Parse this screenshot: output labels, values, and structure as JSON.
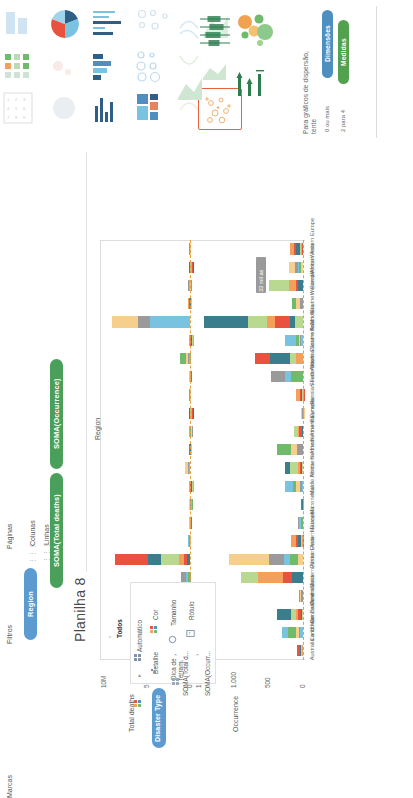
{
  "show_me": {
    "panel_name": "Mostre-me",
    "hint_title": "Para gráficos de dispersão,",
    "hint_title2": "tente",
    "dimensions_pill": "Dimensões",
    "dimensions_req": "0 ou mais",
    "measures_pill": "Medidas",
    "measures_req": "2 para 4",
    "selected_thumb": "scatter-plot",
    "accent_selected": "#e8603c",
    "thumbs": [
      {
        "name": "text-table",
        "row": 0,
        "col": 0
      },
      {
        "name": "heat-map",
        "row": 1,
        "col": 0
      },
      {
        "name": "highlight-table",
        "row": 2,
        "col": 0
      },
      {
        "name": "symbol-map",
        "row": 0,
        "col": 1
      },
      {
        "name": "filled-map",
        "row": 1,
        "col": 1
      },
      {
        "name": "pie-chart",
        "row": 2,
        "col": 1
      },
      {
        "name": "horizontal-bar",
        "row": 0,
        "col": 2
      },
      {
        "name": "stacked-bar",
        "row": 1,
        "col": 2
      },
      {
        "name": "side-by-side-bar",
        "row": 2,
        "col": 2
      },
      {
        "name": "treemap",
        "row": 0,
        "col": 3
      },
      {
        "name": "circle-view",
        "row": 1,
        "col": 3
      },
      {
        "name": "side-by-side-circle",
        "row": 2,
        "col": 3
      },
      {
        "name": "line-discrete",
        "row": 0,
        "col": 4
      },
      {
        "name": "line-continuous",
        "row": 1,
        "col": 4
      },
      {
        "name": "dual-line",
        "row": 2,
        "col": 4
      },
      {
        "name": "area-continuous",
        "row": 0,
        "col": 5
      },
      {
        "name": "area-discrete",
        "row": 1,
        "col": 5
      },
      {
        "name": "scatter-plot",
        "row": 2,
        "col": 5
      },
      {
        "name": "box-and-whisker",
        "row": 0,
        "col": 6
      },
      {
        "name": "packed-bubbles",
        "row": 1,
        "col": 6
      },
      {
        "name": "gantt",
        "row": 2,
        "col": 6
      },
      {
        "name": "bullet-graph",
        "row": 0,
        "col": 7
      },
      {
        "name": "histogram",
        "row": 1,
        "col": 7
      }
    ]
  },
  "workbench": {
    "pages_label": "Páginas",
    "filters_label": "Filtros",
    "marks_label": "Marcas",
    "columns_label": "Colunas",
    "rows_label": "Linhas",
    "sheet_title": "Planilha 8",
    "columns_pills": [
      {
        "label": "SOMA(Total deaths)",
        "type": "green"
      },
      {
        "label": "SOMA(Occurrence)",
        "type": "green"
      }
    ],
    "rows_pills": [
      {
        "label": "Region",
        "type": "blue"
      }
    ]
  },
  "marks_card": {
    "title": "Marcas",
    "all_label": "Todos",
    "mark_type": "Automático",
    "buttons": [
      {
        "name": "color",
        "label": "Cor"
      },
      {
        "name": "size",
        "label": "Tamanho"
      },
      {
        "name": "label",
        "label": "Rótulo"
      },
      {
        "name": "detail",
        "label": "Detalhe"
      },
      {
        "name": "tooltip",
        "label": "Dica de\nferram."
      }
    ],
    "mark_pill": "Disaster Type",
    "measure_cards": [
      {
        "label": "SOMA(Total d..."
      },
      {
        "label": "SOMA(Occurr..."
      }
    ]
  },
  "chart_data": {
    "type": "bar",
    "orientation": "horizontal-stacked",
    "title": "",
    "xlabel": "Region",
    "panes": [
      {
        "name": "total-deaths-pane",
        "measure": "Total deaths",
        "axis_label": "Total deaths",
        "ticks": [
          "10M",
          "5M",
          "0M"
        ],
        "xlim": [
          0,
          12000000
        ],
        "grid": false
      },
      {
        "name": "occurrence-pane",
        "measure": "Occurrence",
        "axis_label": "Occurrence",
        "ticks": [
          "1.500",
          "1.000",
          "500",
          "0"
        ],
        "xlim": [
          0,
          1700
        ],
        "grid": false
      }
    ],
    "legend_field": "Disaster Type",
    "colors": {
      "Flood": "#7ac3e0",
      "Storm": "#f4a05a",
      "Earthquake": "#6fba6b",
      "Epidemic": "#e8523f",
      "Drought": "#f6cf8c",
      "Landslide": "#3a7d8c",
      "Extreme temperature": "#9a9a9a",
      "Other": "#b8d98f"
    },
    "annotation": "33 mil as",
    "categories": [
      "Western Europe",
      "Western Asia",
      "Western Africa",
      "Southern Europe",
      "South Asia",
      "Southern Africa",
      "South-Eastern Asia",
      "South America",
      "Russian Federation",
      "Polynesia",
      "Northern Europe",
      "Northern America",
      "Northern Africa",
      "Middle Africa",
      "Micronesia",
      "Melanesia",
      "Eastern Europe",
      "Eastern Asia",
      "Eastern Africa",
      "Central Asia",
      "Central America",
      "Caribbean",
      "Australia and New Zealand"
    ],
    "series_total_deaths": {
      "name": "Total deaths",
      "values": [
        160000,
        95000,
        320000,
        290000,
        10900000,
        85000,
        1400000,
        180000,
        140000,
        2000,
        110000,
        75000,
        650000,
        95000,
        1000,
        5000,
        230000,
        10400000,
        1250000,
        60000,
        90000,
        350000,
        3000
      ]
    },
    "series_occurrence": {
      "name": "Occurrence",
      "values": [
        210,
        230,
        560,
        180,
        1620,
        290,
        790,
        520,
        110,
        30,
        150,
        430,
        300,
        290,
        40,
        80,
        200,
        1210,
        1010,
        70,
        420,
        340,
        90
      ]
    }
  }
}
